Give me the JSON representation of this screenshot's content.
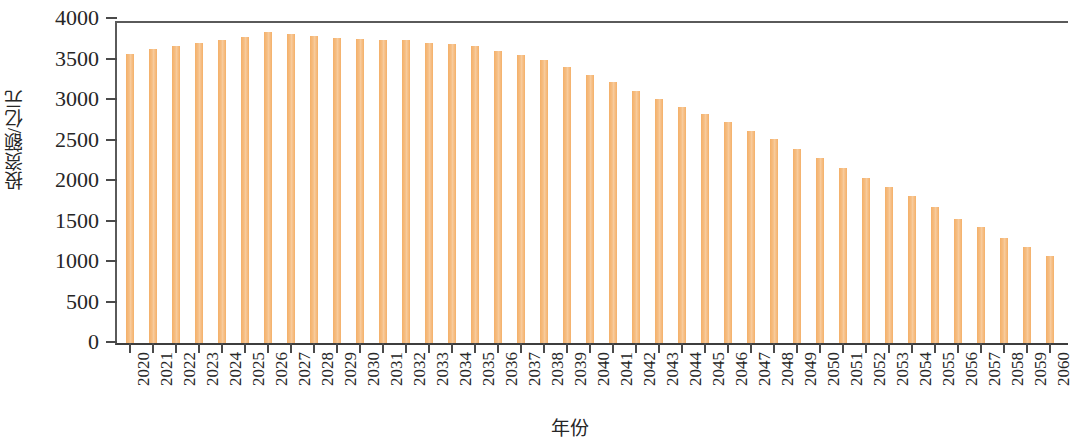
{
  "chart_data": {
    "type": "bar",
    "title": "",
    "subtitle": "",
    "xlabel": "年份",
    "ylabel": "投资额/亿元",
    "ylim": [
      0,
      4000
    ],
    "yticks": [
      0,
      500,
      1000,
      1500,
      2000,
      2500,
      3000,
      3500,
      4000
    ],
    "ytick_labels": [
      "0",
      "500",
      "1000",
      "1500",
      "2000",
      "2500",
      "3000",
      "3500",
      "4000"
    ],
    "grid": false,
    "legend": null,
    "bar_color": "#f4b069",
    "categories": [
      "2020",
      "2021",
      "2022",
      "2023",
      "2024",
      "2025",
      "2026",
      "2027",
      "2028",
      "2029",
      "2030",
      "2031",
      "2032",
      "2033",
      "2034",
      "2035",
      "2036",
      "2037",
      "2038",
      "2039",
      "2040",
      "2041",
      "2042",
      "2043",
      "2044",
      "2045",
      "2046",
      "2047",
      "2048",
      "2049",
      "2050",
      "2051",
      "2052",
      "2053",
      "2054",
      "2055",
      "2056",
      "2057",
      "2058",
      "2059",
      "2060"
    ],
    "values": [
      3570,
      3630,
      3670,
      3710,
      3740,
      3780,
      3840,
      3810,
      3790,
      3770,
      3750,
      3740,
      3740,
      3700,
      3690,
      3670,
      3610,
      3560,
      3500,
      3410,
      3310,
      3220,
      3110,
      3010,
      2910,
      2830,
      2730,
      2620,
      2520,
      2400,
      2290,
      2160,
      2040,
      1930,
      1810,
      1680,
      1530,
      1430,
      1300,
      1190,
      1080
    ]
  },
  "axes": {
    "y_title": "投资额/亿元",
    "x_title": "年份"
  }
}
